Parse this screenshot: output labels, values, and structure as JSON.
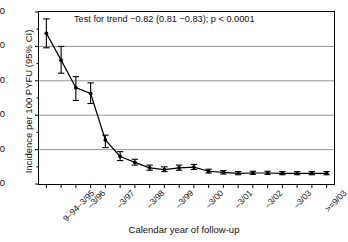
{
  "chart_data": {
    "type": "line",
    "title": "",
    "xlabel": "Calendar year of follow-up",
    "ylabel": "Incidence per 100 PYFU (95% CI)",
    "ylim": [
      0,
      50
    ],
    "yticks": [
      0,
      10,
      20,
      30,
      40,
      50
    ],
    "grid": "horizontal",
    "legend": "none",
    "annotation": "Test for trend −0.82 (0.81 −0.83); p < 0.0001",
    "categories": [
      "9–94–3/95",
      "",
      "–3/96",
      "",
      "–3/97",
      "",
      "–3/98",
      "",
      "–3/99",
      "",
      "–3/00",
      "",
      "–3/01",
      "",
      "–3/02",
      "",
      "–3/03",
      "",
      ">=9/03",
      ""
    ],
    "tick_labels_shown": [
      "9–94–3/95",
      "–3/96",
      "–3/97",
      "–3/98",
      "–3/99",
      "–3/00",
      "–3/01",
      "–3/02",
      "–3/03",
      ">=9/03"
    ],
    "tick_label_positions": [
      0,
      2,
      4,
      6,
      8,
      10,
      12,
      14,
      16,
      18
    ],
    "series": [
      {
        "name": "Incidence per 100 PYFU",
        "values": [
          43.8,
          36.0,
          28.0,
          26.3,
          12.8,
          8.0,
          6.3,
          4.7,
          4.2,
          4.7,
          4.9,
          3.7,
          3.4,
          3.1,
          3.2,
          3.2,
          3.1,
          3.1,
          3.1,
          3.1
        ],
        "ci_lower": [
          39.6,
          32.2,
          24.3,
          23.4,
          10.6,
          6.8,
          5.5,
          4.0,
          3.6,
          4.0,
          4.2,
          3.2,
          2.9,
          2.7,
          2.8,
          2.8,
          2.7,
          2.7,
          2.7,
          2.7
        ],
        "ci_upper": [
          48.0,
          40.0,
          31.2,
          29.4,
          14.2,
          9.4,
          7.2,
          5.5,
          5.0,
          5.5,
          5.7,
          4.3,
          3.9,
          3.6,
          3.7,
          3.7,
          3.6,
          3.6,
          3.6,
          3.6
        ]
      }
    ]
  }
}
